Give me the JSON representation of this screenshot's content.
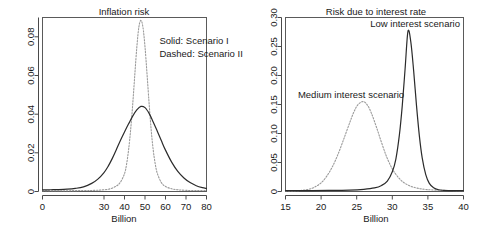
{
  "figure": {
    "background": "#ffffff",
    "panel_count": 2
  },
  "chart_data": [
    {
      "type": "line",
      "panel": "left",
      "title": "Inflation risk",
      "xlabel": "Billion",
      "ylabel": "",
      "xlim": [
        0,
        80
      ],
      "ylim": [
        0,
        0.09
      ],
      "xticks": [
        0,
        30,
        40,
        50,
        60,
        70,
        80
      ],
      "xticklabels": [
        "0",
        "30",
        "40",
        "50",
        "60",
        "70",
        "80"
      ],
      "yticks": [
        0,
        0.02,
        0.04,
        0.06,
        0.08
      ],
      "yticklabels": [
        "0",
        "0.02",
        "0.04",
        "0.06",
        "0.08"
      ],
      "grid": false,
      "legend_position": "upper-right-inside",
      "annotations": [
        {
          "text": "Solid: Scenario I",
          "x": 57,
          "y": 0.0765
        },
        {
          "text": "Dashed: Scenario II",
          "x": 57,
          "y": 0.0695
        }
      ],
      "series": [
        {
          "name": "Scenario I",
          "style": "solid",
          "color": "#2b2b2b",
          "peak_x": 48,
          "peak_y": 0.044,
          "x": [
            0,
            4,
            8,
            12,
            16,
            20,
            24,
            27,
            30,
            32,
            34,
            36,
            38,
            40,
            42,
            44,
            46,
            48,
            50,
            52,
            54,
            56,
            58,
            60,
            63,
            66,
            69,
            72,
            75,
            78,
            80
          ],
          "y": [
            0.0008,
            0.0009,
            0.001,
            0.0012,
            0.0016,
            0.0024,
            0.0042,
            0.0064,
            0.0098,
            0.013,
            0.017,
            0.0216,
            0.0264,
            0.0308,
            0.035,
            0.039,
            0.0422,
            0.044,
            0.0434,
            0.0404,
            0.036,
            0.0312,
            0.0262,
            0.0214,
            0.0152,
            0.0104,
            0.007,
            0.0046,
            0.003,
            0.002,
            0.0016
          ]
        },
        {
          "name": "Scenario II",
          "style": "dashed",
          "color": "#9a9a9a",
          "peak_x": 47.5,
          "peak_y": 0.0885,
          "x": [
            0,
            10,
            20,
            26,
            30,
            33,
            36,
            38,
            40,
            41,
            42,
            43,
            44,
            45,
            46,
            47,
            48,
            49,
            50,
            51,
            52,
            53,
            54,
            55,
            56,
            58,
            60,
            63,
            66,
            70,
            75,
            80
          ],
          "y": [
            0.0004,
            0.0004,
            0.0005,
            0.0006,
            0.0009,
            0.0014,
            0.0028,
            0.0048,
            0.0092,
            0.014,
            0.0216,
            0.032,
            0.045,
            0.06,
            0.0745,
            0.085,
            0.0885,
            0.085,
            0.0748,
            0.0606,
            0.0456,
            0.032,
            0.0216,
            0.0142,
            0.0094,
            0.0046,
            0.0026,
            0.0014,
            0.0009,
            0.0006,
            0.0005,
            0.0005
          ]
        }
      ]
    },
    {
      "type": "line",
      "panel": "right",
      "title": "Risk due to interest rate",
      "xlabel": "Billion",
      "ylabel": "",
      "xlim": [
        15,
        40
      ],
      "ylim": [
        0,
        0.3
      ],
      "xticks": [
        15,
        20,
        25,
        30,
        35,
        40
      ],
      "xticklabels": [
        "15",
        "20",
        "25",
        "30",
        "35",
        "40"
      ],
      "yticks": [
        0,
        0.05,
        0.1,
        0.15,
        0.2,
        0.25,
        0.3
      ],
      "yticklabels": [
        "0",
        "0.05",
        "0.10",
        "0.15",
        "0.20",
        "0.25",
        "0.30"
      ],
      "grid": false,
      "legend_position": "inline-annotations",
      "annotations": [
        {
          "text": "Low interest scenario",
          "x": 33.2,
          "y": 0.283
        },
        {
          "text": "Medium interest scenario",
          "x": 24.2,
          "y": 0.162
        }
      ],
      "series": [
        {
          "name": "Low interest scenario",
          "style": "solid",
          "color": "#2b2b2b",
          "peak_x": 32.2,
          "peak_y": 0.276,
          "x": [
            15,
            18,
            21,
            24,
            26,
            27.5,
            28.5,
            29.3,
            30,
            30.5,
            31,
            31.4,
            31.8,
            32.2,
            32.6,
            33,
            33.4,
            33.8,
            34.2,
            34.7,
            35.2,
            35.8,
            36.5,
            37.2,
            38,
            39,
            40
          ],
          "y": [
            0.0015,
            0.0016,
            0.0018,
            0.0024,
            0.0038,
            0.0062,
            0.0105,
            0.018,
            0.034,
            0.056,
            0.098,
            0.148,
            0.212,
            0.276,
            0.258,
            0.208,
            0.148,
            0.096,
            0.058,
            0.029,
            0.014,
            0.0065,
            0.003,
            0.002,
            0.0016,
            0.0014,
            0.0014
          ]
        },
        {
          "name": "Medium interest scenario",
          "style": "dashed",
          "color": "#9a9a9a",
          "peak_x": 25.9,
          "peak_y": 0.155,
          "x": [
            15,
            16.5,
            18,
            19,
            20,
            20.8,
            21.6,
            22.4,
            23.2,
            24,
            24.6,
            25.2,
            25.9,
            26.5,
            27.1,
            27.8,
            28.5,
            29.2,
            30,
            30.8,
            31.6,
            32.5,
            33.5,
            34.5,
            35.5,
            37,
            38.5,
            40
          ],
          "y": [
            0.001,
            0.0012,
            0.0032,
            0.007,
            0.015,
            0.0265,
            0.043,
            0.065,
            0.091,
            0.118,
            0.137,
            0.15,
            0.155,
            0.149,
            0.134,
            0.11,
            0.084,
            0.06,
            0.039,
            0.025,
            0.0155,
            0.0095,
            0.0058,
            0.0038,
            0.0028,
            0.002,
            0.0016,
            0.0014
          ]
        }
      ]
    }
  ]
}
